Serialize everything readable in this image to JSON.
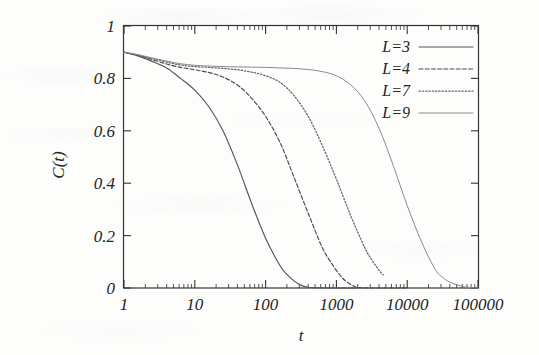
{
  "chart_data": {
    "type": "line",
    "title": "",
    "xlabel": "t",
    "ylabel": "C(t)",
    "xscale": "log",
    "yscale": "linear",
    "xlim": [
      1,
      100000
    ],
    "ylim": [
      0,
      1
    ],
    "grid": false,
    "legend_position": "top-right",
    "xticks": [
      {
        "value": 1,
        "label": "1"
      },
      {
        "value": 10,
        "label": "10"
      },
      {
        "value": 100,
        "label": "100"
      },
      {
        "value": 1000,
        "label": "1000"
      },
      {
        "value": 10000,
        "label": "10000"
      },
      {
        "value": 100000,
        "label": "100000"
      }
    ],
    "yticks": [
      {
        "value": 0,
        "label": "0"
      },
      {
        "value": 0.2,
        "label": "0.2"
      },
      {
        "value": 0.4,
        "label": "0.4"
      },
      {
        "value": 0.6,
        "label": "0.6"
      },
      {
        "value": 0.8,
        "label": "0.8"
      },
      {
        "value": 1,
        "label": "1"
      }
    ],
    "series": [
      {
        "name": "L=3",
        "style": "solid",
        "color": "#555555",
        "x": [
          1,
          1.6,
          2.5,
          4,
          6.3,
          10,
          16,
          25,
          40,
          63,
          100,
          160,
          200,
          250,
          300,
          350,
          400,
          600,
          1000,
          2000
        ],
        "y": [
          0.9,
          0.885,
          0.865,
          0.84,
          0.8,
          0.755,
          0.69,
          0.6,
          0.47,
          0.325,
          0.19,
          0.085,
          0.052,
          0.028,
          0.013,
          0.006,
          0.003,
          0.001,
          0.0,
          0.0
        ]
      },
      {
        "name": "L=4",
        "style": "dashed",
        "color": "#4a4a4a",
        "x": [
          1,
          1.6,
          2.5,
          4,
          6.3,
          10,
          16,
          25,
          40,
          63,
          100,
          160,
          250,
          400,
          630,
          900,
          1200,
          1500,
          1800,
          2000,
          3000,
          10000
        ],
        "y": [
          0.9,
          0.888,
          0.872,
          0.855,
          0.842,
          0.833,
          0.822,
          0.805,
          0.775,
          0.725,
          0.655,
          0.555,
          0.425,
          0.285,
          0.155,
          0.085,
          0.04,
          0.018,
          0.006,
          0.002,
          0.0,
          0.0
        ]
      },
      {
        "name": "L=7",
        "style": "dotted",
        "color": "#646464",
        "x": [
          1,
          1.6,
          2.5,
          4,
          6.3,
          10,
          16,
          25,
          40,
          63,
          100,
          160,
          250,
          400,
          630,
          1000,
          1600,
          2500,
          3200,
          4000,
          4600
        ],
        "y": [
          0.9,
          0.889,
          0.876,
          0.862,
          0.851,
          0.845,
          0.842,
          0.838,
          0.833,
          0.824,
          0.81,
          0.785,
          0.735,
          0.655,
          0.545,
          0.415,
          0.275,
          0.155,
          0.105,
          0.068,
          0.05
        ]
      },
      {
        "name": "L=9",
        "style": "thin-solid",
        "color": "#8a8a8a",
        "x": [
          1,
          1.6,
          2.5,
          4,
          6.3,
          10,
          16,
          25,
          40,
          63,
          100,
          160,
          250,
          400,
          630,
          1000,
          1600,
          2500,
          4000,
          6300,
          10000,
          16000,
          25000,
          32000,
          40000,
          63000,
          100000
        ],
        "y": [
          0.9,
          0.89,
          0.878,
          0.866,
          0.856,
          0.85,
          0.847,
          0.845,
          0.844,
          0.843,
          0.842,
          0.84,
          0.838,
          0.834,
          0.826,
          0.81,
          0.775,
          0.715,
          0.61,
          0.47,
          0.315,
          0.175,
          0.07,
          0.04,
          0.022,
          0.005,
          0.0
        ]
      }
    ]
  },
  "legend": {
    "entries": [
      {
        "label": "L=3"
      },
      {
        "label": "L=4"
      },
      {
        "label": "L=7"
      },
      {
        "label": "L=9"
      }
    ]
  },
  "axes": {
    "x_title": "t",
    "y_title": "C(t)"
  }
}
